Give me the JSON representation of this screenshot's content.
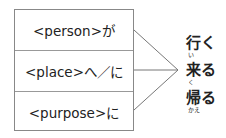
{
  "diagram": {
    "left_items": [
      {
        "label": "<person>が"
      },
      {
        "label": "<place>へ／に"
      },
      {
        "label": "<purpose>に"
      }
    ],
    "right_items": [
      {
        "verb": "行く",
        "furigana": "い"
      },
      {
        "verb": "来る",
        "furigana": "く"
      },
      {
        "verb": "帰る",
        "furigana": "かえ"
      }
    ]
  }
}
